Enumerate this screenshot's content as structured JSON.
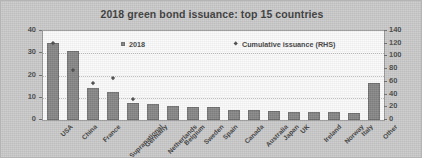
{
  "chart_data": {
    "type": "bar",
    "title": "2018 green bond issuance: top 15 countries",
    "xlabel": "",
    "ylabel": "USD Billions",
    "ylabel_right": "",
    "grid": true,
    "legend_position": "inside-top",
    "ylim": [
      0,
      40
    ],
    "ylim_right": [
      0,
      140
    ],
    "yticks": [
      0,
      10,
      20,
      30,
      40
    ],
    "yticks_right": [
      0,
      20,
      40,
      60,
      80,
      100,
      120,
      140
    ],
    "categories": [
      "USA",
      "China",
      "France",
      "Supranational",
      "Germany",
      "Netherlands",
      "Belgium",
      "Sweden",
      "Spain",
      "Canada",
      "Australia",
      "Japan",
      "UK",
      "Ireland",
      "Norway",
      "Italy",
      "Other"
    ],
    "series": [
      {
        "name": "2018",
        "type": "bar",
        "axis": "left",
        "color": "#858585",
        "values": [
          34.5,
          31.0,
          14.2,
          12.5,
          7.8,
          7.3,
          6.3,
          6.0,
          5.8,
          4.5,
          4.4,
          4.2,
          3.8,
          3.6,
          3.5,
          3.2,
          16.5
        ]
      },
      {
        "name": "Cumulative issuance (RHS)",
        "type": "scatter",
        "axis": "right",
        "color": "#4d4d4d",
        "values": [
          120,
          78,
          58,
          66,
          33,
          null,
          null,
          null,
          null,
          null,
          null,
          null,
          null,
          null,
          null,
          null,
          null
        ]
      }
    ]
  },
  "legend": {
    "items": [
      {
        "label": "2018",
        "marker": "square-marker"
      },
      {
        "label": "Cumulative issuance (RHS)",
        "marker": "diamond-marker"
      }
    ]
  }
}
